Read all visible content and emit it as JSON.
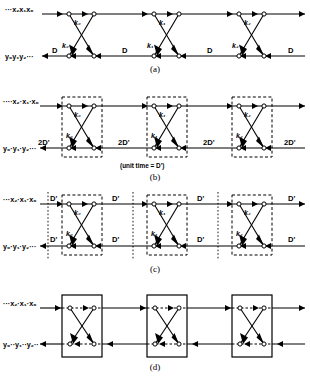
{
  "figure": {
    "title": "",
    "panels": [
      {
        "id": "a",
        "caption": "(a)",
        "top_label": "···x₂x₁x₀",
        "bottom_label": "y₀y₁y₂···",
        "stage_labels": [
          "k₀",
          "k₁",
          "k₂"
        ],
        "delay_labels": [
          "D",
          "D",
          "D",
          "D"
        ],
        "note": "",
        "box_style": "none"
      },
      {
        "id": "b",
        "caption": "(b)",
        "top_label": "····x₂·x₁·x₀",
        "bottom_label": "y₀·y₁·y₂···",
        "stage_labels": [
          "k₀",
          "k₁",
          "k₂"
        ],
        "delay_labels": [
          "2D'",
          "2D'",
          "2D'",
          "2D'"
        ],
        "note": "(unit time = D')",
        "box_style": "dashed"
      },
      {
        "id": "c",
        "caption": "(c)",
        "top_label": "···x₂·x₁·x₀",
        "bottom_label": "y₀·y₁·y₂···",
        "stage_labels": [
          "k₀",
          "k₁",
          "k₂"
        ],
        "delay_labels_top": [
          "D'",
          "D'",
          "D'",
          "D'"
        ],
        "delay_labels_bottom": [
          "D'",
          "D'",
          "D'",
          "D'"
        ],
        "note": "",
        "box_style": "dashed-with-dotted-dividers"
      },
      {
        "id": "d",
        "caption": "(d)",
        "top_label": "···x₂·x₁·x₀",
        "bottom_label": "y₀··y₁··y₂··",
        "stage_labels": [
          "",
          "",
          ""
        ],
        "delay_labels": [],
        "note": "",
        "box_style": "solid"
      }
    ],
    "colors": {
      "line": "#000000",
      "background": "#ffffff",
      "node_fill": "#ffffff"
    }
  }
}
